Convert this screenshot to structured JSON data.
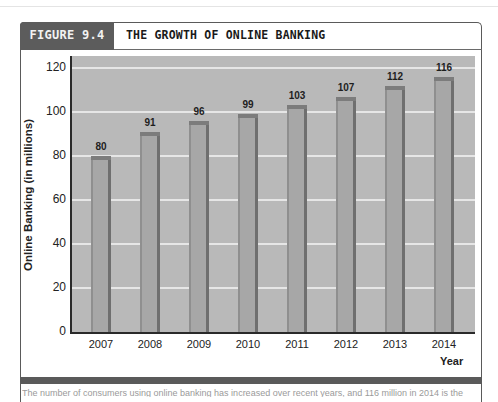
{
  "figure": {
    "number_label": "FIGURE 9.4",
    "title": "THE GROWTH OF ONLINE BANKING"
  },
  "caption": "The number of consumers using online banking has increased over recent years, and 116 million in 2014 is the",
  "colors": {
    "header_tab": "#5c5c5c",
    "plot_bg": "#b9b9b9",
    "bar_fill": "#a7a7a7",
    "bar_edge": "#6f6f6f",
    "gridline": "#e6e6e6",
    "footer_bar": "#5a5a5a"
  },
  "chart_data": {
    "type": "bar",
    "title": "THE GROWTH OF ONLINE BANKING",
    "categories": [
      "2007",
      "2008",
      "2009",
      "2010",
      "2011",
      "2012",
      "2013",
      "2014"
    ],
    "values": [
      80,
      91,
      96,
      99,
      103,
      107,
      112,
      116
    ],
    "data_labels": [
      "80",
      "91",
      "96",
      "99",
      "103",
      "107",
      "112",
      "116"
    ],
    "xlabel": "Year",
    "ylabel": "Online Banking (in millions)",
    "ylim": [
      0,
      120
    ],
    "yticks": [
      "0",
      "20",
      "40",
      "60",
      "80",
      "100",
      "120"
    ],
    "grid": true,
    "legend": null
  }
}
